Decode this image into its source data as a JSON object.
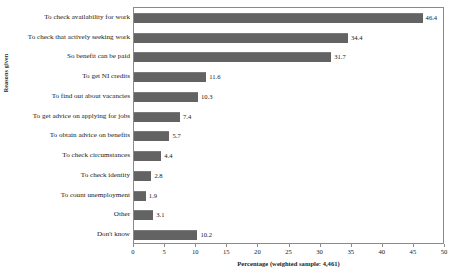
{
  "chart_data": {
    "type": "bar",
    "orientation": "horizontal",
    "title": "",
    "xlabel": "Percentage (weighted sample: 4,461)",
    "ylabel": "Reasons given",
    "xlim": [
      0,
      50
    ],
    "xticks": [
      0,
      5,
      10,
      15,
      20,
      25,
      30,
      35,
      40,
      45,
      50
    ],
    "grid": false,
    "legend": false,
    "bar_color": "#636363",
    "categories": [
      "To check availability for work",
      "To check that actively seeking work",
      "So benefit can be paid",
      "To get NI credits",
      "To find out about vacancies",
      "To get advice on applying for jobs",
      "To obtain advice on benefits",
      "To check circumstances",
      "To check identity",
      "To count unemployment",
      "Other",
      "Don't know"
    ],
    "values": [
      46.4,
      34.4,
      31.7,
      11.6,
      10.3,
      7.4,
      5.7,
      4.4,
      2.8,
      1.9,
      3.1,
      10.2
    ],
    "value_labels": [
      "46.4",
      "34.4",
      "31.7",
      "11.6",
      "10.3",
      "7.4",
      "5.7",
      "4.4",
      "2.8",
      "1.9",
      "3.1",
      "10.2"
    ],
    "xtick_labels": [
      "0",
      "5",
      "10",
      "15",
      "20",
      "25",
      "30",
      "35",
      "40",
      "45",
      "50"
    ]
  }
}
